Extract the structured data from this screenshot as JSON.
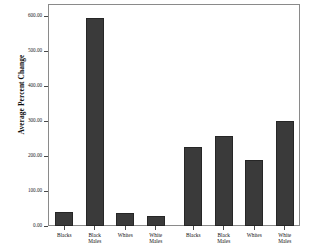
{
  "chart_data": {
    "type": "bar",
    "title": "",
    "xlabel": "",
    "ylabel": "Average Percent Change",
    "ylim": [
      0,
      600
    ],
    "ytick_labels": [
      "0.00",
      "100.00",
      "200.00",
      "300.00",
      "400.00",
      "500.00",
      "600.00"
    ],
    "ytick_values": [
      0,
      100,
      200,
      300,
      400,
      500,
      600
    ],
    "grid": false,
    "legend": "none",
    "panels": [
      {
        "title": "Industrial Shift, 1980 to 1990",
        "categories": [
          "Blacks",
          "Black\nMales",
          "Whites",
          "White\nMales"
        ],
        "values": [
          40,
          595,
          38,
          28
        ]
      },
      {
        "title": "Industrial Shift, 1990 to 2000",
        "categories": [
          "Blacks",
          "Black\nMales",
          "Whites",
          "White\nMales"
        ],
        "values": [
          225,
          258,
          190,
          300
        ]
      }
    ]
  }
}
